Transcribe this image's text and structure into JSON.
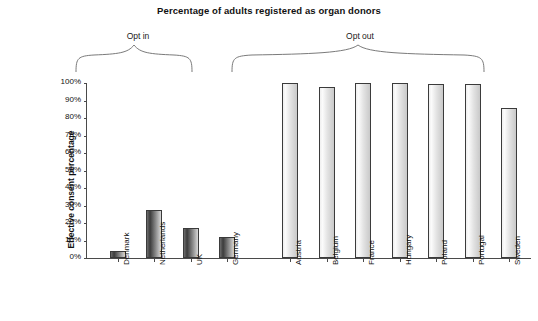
{
  "chart_data": {
    "type": "bar",
    "title": "Percentage of adults registered as organ donors",
    "xlabel": "",
    "ylabel": "Effective consent percentage",
    "ylim": [
      0,
      100
    ],
    "grid": false,
    "legend_position": "none",
    "y_ticks": [
      "0%",
      "10%",
      "20%",
      "30%",
      "40%",
      "50%",
      "60%",
      "70%",
      "80%",
      "90%",
      "100%"
    ],
    "y_tick_values": [
      0,
      10,
      20,
      30,
      40,
      50,
      60,
      70,
      80,
      90,
      100
    ],
    "categories": [
      "Denmark",
      "Netherlands",
      "UK",
      "Germany",
      "Austria",
      "Belgium",
      "France",
      "Hungary",
      "Poland",
      "Portugal",
      "Sweden"
    ],
    "values": [
      4.25,
      27.5,
      17.17,
      12,
      99.98,
      98,
      99.91,
      99.97,
      99.5,
      99.64,
      85.9
    ],
    "annotations": [
      {
        "label": "Opt in",
        "categories": [
          "Denmark",
          "Netherlands",
          "UK",
          "Germany"
        ]
      },
      {
        "label": "Opt out",
        "categories": [
          "Austria",
          "Belgium",
          "France",
          "Hungary",
          "Poland",
          "Portugal",
          "Sweden"
        ]
      }
    ],
    "bar_styles": [
      "dark",
      "dark",
      "dark",
      "dark",
      "light",
      "light",
      "light",
      "light",
      "light",
      "light",
      "light"
    ],
    "colors": {
      "bar_dark_start": "#6d6d6d",
      "bar_dark_end": "#d8d8d8",
      "bar_light_start": "#efefef",
      "bar_light_end": "#c9c9c9",
      "bar_outline": "#3b3b3b",
      "axis": "#4a4a4a",
      "text": "#111111",
      "background": "#ffffff"
    }
  },
  "groups": {
    "opt_in_label": "Opt in",
    "opt_out_label": "Opt out"
  }
}
